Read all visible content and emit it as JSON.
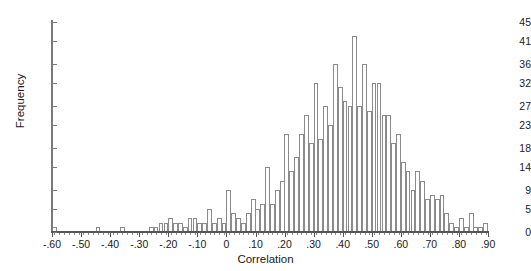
{
  "chart_data": {
    "type": "bar",
    "title": "",
    "subtitle": "",
    "xlabel": "Correlation",
    "ylabel": "Frequency",
    "grid": false,
    "legend": null,
    "xlim": [
      -0.6,
      0.9
    ],
    "ylim": [
      0,
      45
    ],
    "bin_width": 0.0167,
    "x_tick_labels": [
      "-.60",
      "-.50",
      "-.40",
      "-.30",
      "-.20",
      "-.10",
      "0",
      ".10",
      ".20",
      ".30",
      ".40",
      ".50",
      ".60",
      ".70",
      ".80",
      ".90"
    ],
    "x_tick_values": [
      -0.6,
      -0.5,
      -0.4,
      -0.3,
      -0.2,
      -0.1,
      0.0,
      0.1,
      0.2,
      0.3,
      0.4,
      0.5,
      0.6,
      0.7,
      0.8,
      0.9
    ],
    "y_tick_labels": [
      "0",
      "5",
      "9",
      "14",
      "18",
      "23",
      "27",
      "32",
      "36",
      "41",
      "45"
    ],
    "y_tick_values": [
      0,
      5,
      9,
      14,
      18,
      23,
      27,
      32,
      36,
      41,
      45
    ],
    "bar_fill_color": "#ffffff",
    "bar_edge_color": "#8b8b8b",
    "axis_color": "#555555",
    "categories": [
      -0.592,
      -0.575,
      -0.558,
      -0.542,
      -0.525,
      -0.508,
      -0.492,
      -0.475,
      -0.458,
      -0.442,
      -0.425,
      -0.408,
      -0.392,
      -0.375,
      -0.358,
      -0.342,
      -0.325,
      -0.308,
      -0.292,
      -0.275,
      -0.258,
      -0.242,
      -0.225,
      -0.208,
      -0.192,
      -0.175,
      -0.158,
      -0.142,
      -0.125,
      -0.108,
      -0.092,
      -0.075,
      -0.058,
      -0.042,
      -0.025,
      -0.008,
      0.008,
      0.025,
      0.042,
      0.058,
      0.075,
      0.092,
      0.108,
      0.125,
      0.142,
      0.158,
      0.175,
      0.192,
      0.208,
      0.225,
      0.242,
      0.258,
      0.275,
      0.292,
      0.308,
      0.325,
      0.342,
      0.358,
      0.375,
      0.392,
      0.408,
      0.425,
      0.442,
      0.458,
      0.475,
      0.492,
      0.508,
      0.525,
      0.542,
      0.558,
      0.575,
      0.592,
      0.608,
      0.625,
      0.642,
      0.658,
      0.675,
      0.692,
      0.708,
      0.725,
      0.742,
      0.758,
      0.775,
      0.792,
      0.808,
      0.825,
      0.842,
      0.858,
      0.875,
      0.892
    ],
    "values": [
      1,
      0,
      0,
      0,
      0,
      0,
      0,
      0,
      0,
      1,
      0,
      0,
      0,
      0,
      1,
      0,
      0,
      0,
      0,
      0,
      1,
      1,
      2,
      2,
      3,
      2,
      2,
      1,
      3,
      3,
      2,
      2,
      5,
      2,
      3,
      2,
      9,
      4,
      3,
      2,
      4,
      7,
      5,
      6,
      14,
      6,
      9,
      11,
      21,
      13,
      16,
      21,
      25,
      19,
      32,
      20,
      27,
      23,
      36,
      31,
      28,
      27,
      42,
      27,
      36,
      26,
      32,
      32,
      25,
      25,
      19,
      21,
      15,
      13,
      9,
      13,
      11,
      7,
      8,
      7,
      8,
      4,
      2,
      1,
      3,
      1,
      4,
      1,
      1,
      2
    ]
  }
}
